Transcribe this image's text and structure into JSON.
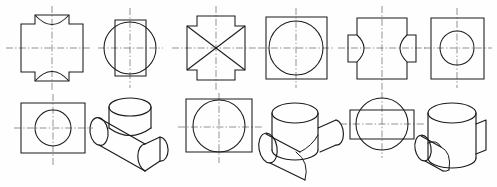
{
  "sheet": {
    "title": "Cylinder Intersection Orthographic and Isometric Views",
    "background": "#fefefe",
    "line_color": "#1a1a1a",
    "centerline_color": "#4a4a4a",
    "width": 497,
    "height": 187
  },
  "groups": [
    {
      "id": "group-1",
      "name": "equal-diameter-through-cylinder",
      "views": [
        {
          "id": "g1-front",
          "name": "front-view-cross-concave-top-bottom",
          "type": "orthographic",
          "description": "Cross outline with concave arcs at top and bottom"
        },
        {
          "id": "g1-side",
          "name": "side-view-circle-over-rectangle",
          "type": "orthographic",
          "description": "Circle larger than the rectangle behind it"
        },
        {
          "id": "g1-top",
          "name": "top-view-rectangle-with-circle",
          "type": "orthographic",
          "description": "Rectangle with centered circle"
        },
        {
          "id": "g1-iso",
          "name": "isometric-tee-branch-cylinder",
          "type": "isometric",
          "description": "Horizontal cylinder with vertical branch cylinder"
        }
      ]
    },
    {
      "id": "group-2",
      "name": "equal-diameter-perpendicular-cylinders",
      "views": [
        {
          "id": "g2-front",
          "name": "front-view-cross-with-diagonals",
          "type": "orthographic",
          "description": "Square with tabs on four sides and X diagonals"
        },
        {
          "id": "g2-side",
          "name": "side-view-square-with-circle",
          "type": "orthographic",
          "description": "Square with inscribed circle"
        },
        {
          "id": "g2-top",
          "name": "top-view-rectangle-with-circle",
          "type": "orthographic",
          "description": "Rectangle with inscribed circle"
        },
        {
          "id": "g2-iso",
          "name": "isometric-crossing-cylinders",
          "type": "isometric",
          "description": "Vertical cylinder crossing horizontal cylinder"
        }
      ]
    },
    {
      "id": "group-3",
      "name": "small-branch-into-large-cylinder",
      "views": [
        {
          "id": "g3-front",
          "name": "front-view-cross-concave-sides",
          "type": "orthographic",
          "description": "Cross outline with concave arcs on left and right"
        },
        {
          "id": "g3-side",
          "name": "side-view-rectangle-with-small-circle",
          "type": "orthographic",
          "description": "Rectangle with small centered circle"
        },
        {
          "id": "g3-top",
          "name": "top-view-circle-over-horizontal-rectangle",
          "type": "orthographic",
          "description": "Large circle with narrow rectangle behind"
        },
        {
          "id": "g3-iso",
          "name": "isometric-vertical-cylinder-small-branch",
          "type": "isometric",
          "description": "Vertical cylinder with small horizontal branch"
        }
      ]
    }
  ]
}
